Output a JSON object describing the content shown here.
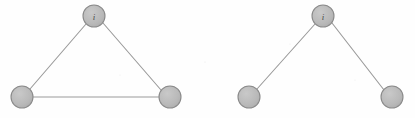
{
  "figure": {
    "background_color": "#fefefe",
    "node_fill_color": "#b8b8b8",
    "node_stroke_color": "#8a8a8a",
    "edge_color": "#9a9a9a",
    "label_color": "#4a4a4a",
    "node_radius": 11
  },
  "graphs": [
    {
      "id": "left-graph",
      "name": "triangle-graph",
      "caption": "",
      "nodes": [
        {
          "id": "left-top",
          "label": "i",
          "cx": 94,
          "cy": 16,
          "r": 11
        },
        {
          "id": "left-bottom-left",
          "label": "",
          "cx": 22,
          "cy": 97,
          "r": 11
        },
        {
          "id": "left-bottom-right",
          "label": "",
          "cx": 170,
          "cy": 97,
          "r": 11
        }
      ],
      "edges": [
        {
          "id": "left-edge-top-bl",
          "from": "left-top",
          "to": "left-bottom-left",
          "x1": 86,
          "y1": 24,
          "x2": 30,
          "y2": 89
        },
        {
          "id": "left-edge-top-br",
          "from": "left-top",
          "to": "left-bottom-right",
          "x1": 103,
          "y1": 23,
          "x2": 161,
          "y2": 90
        },
        {
          "id": "left-edge-bl-br",
          "from": "left-bottom-left",
          "to": "left-bottom-right",
          "x1": 33,
          "y1": 97,
          "x2": 159,
          "y2": 97
        }
      ]
    },
    {
      "id": "right-graph",
      "name": "open-path-graph",
      "caption": "",
      "nodes": [
        {
          "id": "right-top",
          "label": "i",
          "cx": 323,
          "cy": 16,
          "r": 11
        },
        {
          "id": "right-bottom-left",
          "label": "",
          "cx": 249,
          "cy": 97,
          "r": 11
        },
        {
          "id": "right-bottom-right",
          "label": "",
          "cx": 392,
          "cy": 97,
          "r": 11
        }
      ],
      "edges": [
        {
          "id": "right-edge-top-bl",
          "from": "right-top",
          "to": "right-bottom-left",
          "x1": 315,
          "y1": 24,
          "x2": 257,
          "y2": 89
        },
        {
          "id": "right-edge-top-br",
          "from": "right-top",
          "to": "right-bottom-right",
          "x1": 332,
          "y1": 23,
          "x2": 384,
          "y2": 90
        }
      ]
    }
  ]
}
